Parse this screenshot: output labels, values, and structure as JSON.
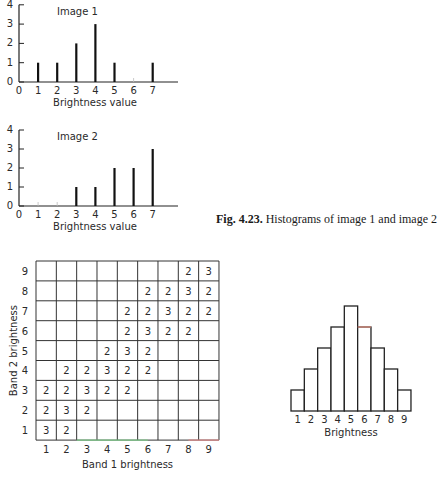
{
  "caption": {
    "figure_number": "Fig. 4.23.",
    "text": "Histograms of image 1 and image 2"
  },
  "chart_data": [
    {
      "type": "bar",
      "title": "Image 1",
      "xlabel": "Brightness value",
      "ylabel": "",
      "x_ticks": [
        "0",
        "1",
        "2",
        "3",
        "4",
        "5",
        "6",
        "7"
      ],
      "y_ticks": [
        "0",
        "1",
        "2",
        "3",
        "4"
      ],
      "categories": [
        1,
        2,
        3,
        4,
        5,
        6,
        7
      ],
      "values": [
        1,
        1,
        2,
        3,
        1,
        0,
        1
      ],
      "ylim": [
        0,
        4
      ],
      "grid": false
    },
    {
      "type": "bar",
      "title": "Image 2",
      "xlabel": "Brightness value",
      "ylabel": "",
      "x_ticks": [
        "0",
        "1",
        "2",
        "3",
        "4",
        "5",
        "6",
        "7"
      ],
      "y_ticks": [
        "0",
        "1",
        "2",
        "3",
        "4"
      ],
      "categories": [
        1,
        2,
        3,
        4,
        5,
        6,
        7
      ],
      "values": [
        0,
        0,
        1,
        1,
        2,
        2,
        3
      ],
      "ylim": [
        0,
        4
      ],
      "grid": false
    },
    {
      "type": "table",
      "title": "",
      "xlabel": "Band 1 brightness",
      "ylabel": "Band 2 brightness",
      "x_ticks": [
        "1",
        "2",
        "3",
        "4",
        "5",
        "6",
        "7",
        "8",
        "9"
      ],
      "y_ticks": [
        "1",
        "2",
        "3",
        "4",
        "5",
        "6",
        "7",
        "8",
        "9"
      ],
      "rows_top_to_bottom": [
        {
          "band2": 9,
          "cells": [
            "",
            "",
            "",
            "",
            "",
            "",
            "",
            "2",
            "3"
          ]
        },
        {
          "band2": 8,
          "cells": [
            "",
            "",
            "",
            "",
            "",
            "2",
            "2",
            "3",
            "2"
          ]
        },
        {
          "band2": 7,
          "cells": [
            "",
            "",
            "",
            "",
            "2",
            "2",
            "3",
            "2",
            "2"
          ]
        },
        {
          "band2": 6,
          "cells": [
            "",
            "",
            "",
            "",
            "2",
            "3",
            "2",
            "2",
            ""
          ]
        },
        {
          "band2": 5,
          "cells": [
            "",
            "",
            "",
            "2",
            "3",
            "2",
            "",
            "",
            ""
          ]
        },
        {
          "band2": 4,
          "cells": [
            "",
            "2",
            "2",
            "3",
            "2",
            "2",
            "",
            "",
            ""
          ]
        },
        {
          "band2": 3,
          "cells": [
            "2",
            "2",
            "3",
            "2",
            "2",
            "",
            "",
            "",
            ""
          ]
        },
        {
          "band2": 2,
          "cells": [
            "2",
            "3",
            "2",
            "",
            "",
            "",
            "",
            "",
            ""
          ]
        },
        {
          "band2": 1,
          "cells": [
            "3",
            "2",
            "",
            "",
            "",
            "",
            "",
            "",
            ""
          ]
        }
      ]
    },
    {
      "type": "bar",
      "title": "",
      "xlabel": "Brightness",
      "ylabel": "",
      "categories": [
        1,
        2,
        3,
        4,
        5,
        6,
        7,
        8,
        9
      ],
      "values": [
        1,
        2,
        3,
        4,
        5,
        4,
        3,
        2,
        1
      ],
      "grid": false
    }
  ]
}
